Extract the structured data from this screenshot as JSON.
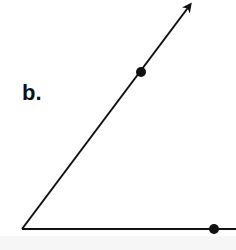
{
  "figure": {
    "label": "b.",
    "colors": {
      "stroke": "#111111",
      "background": "#ffffff"
    },
    "angle": {
      "vertex": [
        22,
        229
      ],
      "ray_to_arrow": {
        "end": [
          192,
          3
        ],
        "has_arrowhead": true,
        "point_on_ray": [
          141,
          72
        ]
      },
      "horizontal_side": {
        "end": [
          236,
          229
        ],
        "has_arrowhead": false,
        "point_on_side": [
          214,
          229
        ]
      }
    }
  }
}
